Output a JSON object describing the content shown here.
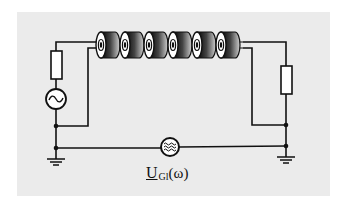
{
  "diagram": {
    "type": "circuit",
    "components": {
      "source_left": {
        "kind": "ac-voltage-source",
        "symbol": "~"
      },
      "resistor_left": {
        "kind": "resistor",
        "role": "source-impedance"
      },
      "resistor_right": {
        "kind": "resistor",
        "role": "load"
      },
      "ferrite_cores": {
        "kind": "ferrite-core",
        "count": 6
      },
      "noise_source": {
        "kind": "broadband-noise-source",
        "symbol": "≋"
      },
      "grounds": {
        "count": 2
      }
    },
    "label": {
      "main": "U",
      "subscript": "Gl",
      "argument": "(ω)"
    }
  }
}
